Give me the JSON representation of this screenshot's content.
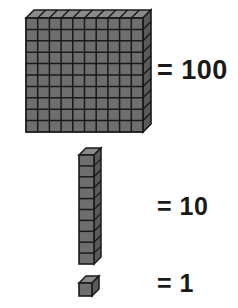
{
  "diagram": {
    "background_color": "#ffffff",
    "palette": {
      "face_fill": "#6e6e6e",
      "top_fill": "#8a8a8a",
      "side_fill": "#5a5a5a",
      "outline": "#1a1a1a",
      "text_color": "#1a1a1a"
    },
    "rows": [
      {
        "id": "hundred",
        "block_name": "flat",
        "equals_label": "= 100",
        "value": 100,
        "unit_count": 100,
        "grid_columns": 10,
        "grid_rows": 10
      },
      {
        "id": "ten",
        "block_name": "rod",
        "equals_label": "= 10",
        "value": 10,
        "unit_count": 10,
        "grid_columns": 1,
        "grid_rows": 10
      },
      {
        "id": "one",
        "block_name": "unit-cube",
        "equals_label": "= 1",
        "value": 1,
        "unit_count": 1,
        "grid_columns": 1,
        "grid_rows": 1
      }
    ]
  }
}
